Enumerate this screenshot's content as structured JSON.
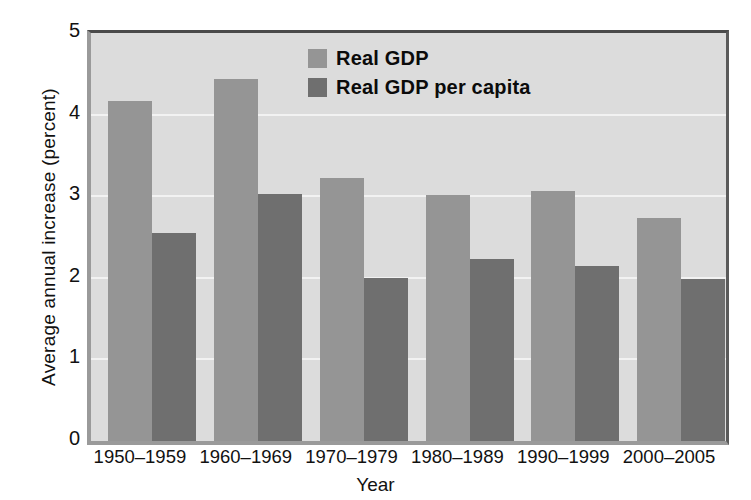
{
  "chart_data": {
    "type": "bar",
    "title": "",
    "xlabel": "Year",
    "ylabel": "Average annual increase (percent)",
    "categories": [
      "1950–1959",
      "1960–1969",
      "1970–1979",
      "1980–1989",
      "1990–1999",
      "2000–2005"
    ],
    "series": [
      {
        "name": "Real GDP",
        "values": [
          4.17,
          4.44,
          3.22,
          3.02,
          3.06,
          2.73
        ],
        "color": "#959595"
      },
      {
        "name": "Real GDP per capita",
        "values": [
          2.55,
          3.03,
          2.0,
          2.23,
          2.15,
          1.99
        ],
        "color": "#6f6f6f"
      }
    ],
    "ylim": [
      0,
      5
    ],
    "yticks": [
      0,
      1,
      2,
      3,
      4,
      5
    ],
    "ytick_labels": [
      "0",
      "1",
      "2",
      "3",
      "4",
      "5"
    ],
    "grid": true,
    "grid_axis": "y",
    "legend_position": "top-center",
    "plot_background": "#dcdcdc",
    "figure_background": "#ffffff"
  },
  "axes": {
    "y_title": "Average annual increase (percent)",
    "x_title": "Year"
  },
  "legend": {
    "entries": [
      {
        "label": "Real GDP",
        "swatch": "#959595"
      },
      {
        "label": "Real GDP per capita",
        "swatch": "#6f6f6f"
      }
    ]
  }
}
